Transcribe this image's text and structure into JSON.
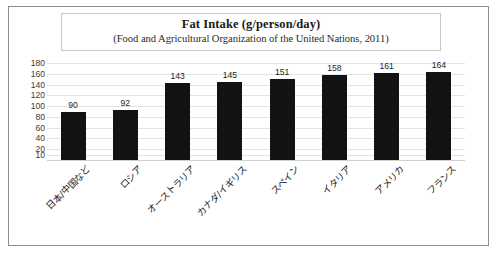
{
  "chart_data": {
    "type": "bar",
    "title": "Fat Intake (g/person/day)",
    "subtitle": "(Food and Agricultural Organization of the United Nations, 2011)",
    "xlabel": "",
    "ylabel": "",
    "categories": [
      "日本/中国など",
      "ロシア",
      "オーストラリア",
      "カナダ/イギリス",
      "スペイン",
      "イタリア",
      "アメリカ",
      "フランス"
    ],
    "values": [
      90,
      92,
      143,
      145,
      151,
      158,
      161,
      164
    ],
    "value_labels": [
      "90",
      "92",
      "143",
      "145",
      "151",
      "158",
      "161",
      "164"
    ],
    "yticks": [
      180,
      160,
      140,
      120,
      100,
      80,
      60,
      40,
      20,
      10
    ],
    "ytick_labels": [
      "180",
      "160",
      "140",
      "120",
      "100",
      "80",
      "60",
      "40",
      "20",
      "10"
    ],
    "ylim": [
      0,
      180
    ],
    "grid": true,
    "legend": false,
    "bar_color": "#121212",
    "grid_color": "#e4e4e4",
    "border_color": "#8d8d8d"
  }
}
